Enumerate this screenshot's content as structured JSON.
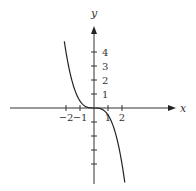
{
  "chart_data": {
    "type": "line",
    "title": "",
    "xlabel": "x",
    "ylabel": "y",
    "x_ticks": [
      -2,
      -1,
      1,
      2
    ],
    "x_tick_labels": [
      "−2",
      "−1",
      "1",
      "2"
    ],
    "y_ticks": [
      1,
      2,
      3,
      4
    ],
    "y_tick_labels": [
      "1",
      "2",
      "3",
      "4"
    ],
    "y_ticks_unlabeled": [
      -1,
      -2,
      -3,
      -4
    ],
    "xlim": [
      -6.7,
      7
    ],
    "ylim": [
      -5.8,
      5.8
    ],
    "grid": false,
    "series": [
      {
        "name": "curve",
        "function": "y = -x^3/2",
        "x": [
          -2.1,
          -2.0,
          -1.5,
          -1.0,
          -0.5,
          0,
          0.5,
          1.0,
          1.5,
          2.0,
          2.3
        ],
        "y": [
          4.63,
          4.0,
          1.69,
          0.5,
          0.06,
          0,
          -0.06,
          -0.5,
          -1.69,
          -4.0,
          -6.08
        ]
      }
    ]
  },
  "labels": {
    "x_axis": "x",
    "y_axis": "y"
  }
}
